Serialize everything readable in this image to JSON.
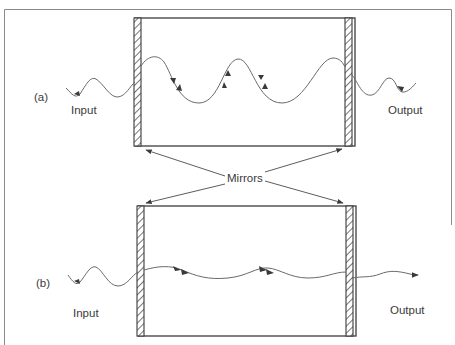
{
  "diagram": {
    "panels": [
      {
        "id": "a",
        "label": "(a)",
        "input_label": "Input",
        "output_label": "Output",
        "description": "standing wave with large amplitude inside cavity"
      },
      {
        "id": "b",
        "label": "(b)",
        "input_label": "Input",
        "output_label": "Output",
        "description": "low-amplitude travelling wave passing through cavity"
      }
    ],
    "mirrors_label": "Mirrors",
    "colors": {
      "line": "#4a4a4a",
      "wave": "#6a6a6a",
      "frame": "#8a8a8a",
      "text": "#3a3a3a"
    }
  }
}
